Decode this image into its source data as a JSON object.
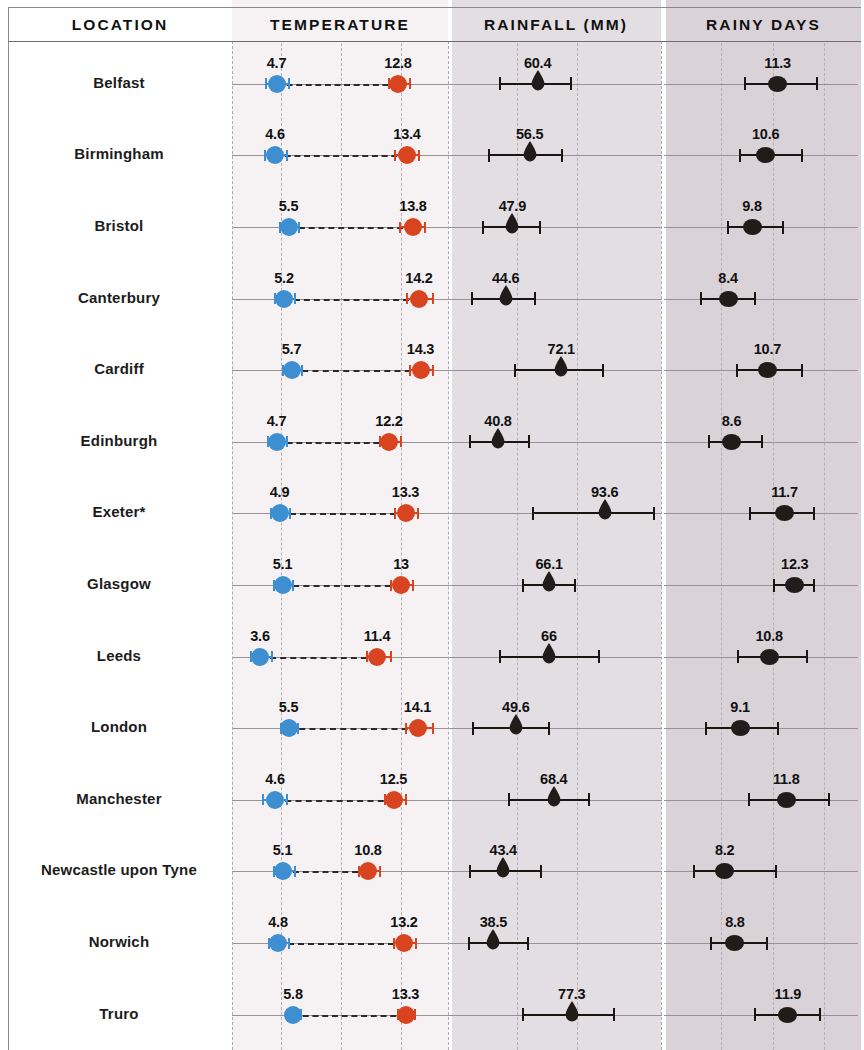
{
  "columns": {
    "location": "LOCATION",
    "temperature": "TEMPERATURE",
    "rainfall": "RAINFALL (MM)",
    "rainy_days": "RAINY DAYS"
  },
  "colors": {
    "min_temp": "#3d8fd1",
    "max_temp": "#d94420",
    "rainfall": "#211b19",
    "rainy_days": "#211b19",
    "panel_location_bg": "#ffffff",
    "panel_temperature_bg": "#f6f2f4",
    "panel_rainfall_bg": "#e3dee2",
    "panel_rainy_days_bg": "#d9d3d8",
    "gridline": "#b6afb8"
  },
  "chart_data": {
    "type": "scatter",
    "title": "",
    "subtitle": "",
    "note": "Dot-and-whisker small-multiples table. Each row is a UK city; each panel plots a mean value (marker) with a range/error bar (whiskers).",
    "panels": [
      {
        "key": "temperature",
        "label": "TEMPERATURE",
        "xlabel": "",
        "ylabel": "",
        "series": [
          {
            "name": "Minimum temperature",
            "color": "#3d8fd1",
            "marker": "circle"
          },
          {
            "name": "Maximum temperature",
            "color": "#d94420",
            "marker": "circle"
          }
        ],
        "xlim": [
          2.0,
          16.0
        ],
        "gridlines": [
          5.0,
          9.0,
          13.0
        ]
      },
      {
        "key": "rainfall",
        "label": "RAINFALL (MM)",
        "xlabel": "",
        "ylabel": "",
        "series": [
          {
            "name": "Mean monthly rainfall",
            "color": "#211b19",
            "marker": "raindrop"
          }
        ],
        "xlim": [
          20,
          120
        ],
        "gridlines": [
          50,
          80
        ]
      },
      {
        "key": "rainy_days",
        "label": "RAINY DAYS",
        "xlabel": "",
        "ylabel": "",
        "series": [
          {
            "name": "Mean rainy days",
            "color": "#211b19",
            "marker": "circle"
          }
        ],
        "xlim": [
          5.0,
          16.0
        ],
        "gridlines": [
          8.0,
          11.0,
          14.0
        ]
      }
    ],
    "categories": [
      "Belfast",
      "Birmingham",
      "Bristol",
      "Canterbury",
      "Cardiff",
      "Edinburgh",
      "Exeter*",
      "Glasgow",
      "Leeds",
      "London",
      "Manchester",
      "Newcastle upon Tyne",
      "Norwich",
      "Truro"
    ],
    "rows": [
      {
        "location": "Belfast",
        "temp_min": 4.7,
        "temp_min_label": "4.7",
        "temp_min_lo": 4.0,
        "temp_min_hi": 5.5,
        "temp_max": 12.8,
        "temp_max_label": "12.8",
        "temp_max_lo": 12.2,
        "temp_max_hi": 13.6,
        "rainfall": 60.4,
        "rainfall_label": "60.4",
        "rainfall_lo": 42.0,
        "rainfall_hi": 77.0,
        "rainy_days": 11.3,
        "rainy_days_label": "11.3",
        "rainy_days_lo": 9.4,
        "rainy_days_hi": 13.6
      },
      {
        "location": "Birmingham",
        "temp_min": 4.6,
        "temp_min_label": "4.6",
        "temp_min_lo": 3.9,
        "temp_min_hi": 5.4,
        "temp_max": 13.4,
        "temp_max_label": "13.4",
        "temp_max_lo": 12.6,
        "temp_max_hi": 14.2,
        "rainfall": 56.5,
        "rainfall_label": "56.5",
        "rainfall_lo": 36.5,
        "rainfall_hi": 72.5,
        "rainy_days": 10.6,
        "rainy_days_label": "10.6",
        "rainy_days_lo": 9.1,
        "rainy_days_hi": 12.7
      },
      {
        "location": "Bristol",
        "temp_min": 5.5,
        "temp_min_label": "5.5",
        "temp_min_lo": 4.9,
        "temp_min_hi": 6.2,
        "temp_max": 13.8,
        "temp_max_label": "13.8",
        "temp_max_lo": 12.9,
        "temp_max_hi": 14.6,
        "rainfall": 47.9,
        "rainfall_label": "47.9",
        "rainfall_lo": 33.5,
        "rainfall_hi": 61.5,
        "rainy_days": 9.8,
        "rainy_days_label": "9.8",
        "rainy_days_lo": 8.4,
        "rainy_days_hi": 11.6
      },
      {
        "location": "Canterbury",
        "temp_min": 5.2,
        "temp_min_label": "5.2",
        "temp_min_lo": 4.6,
        "temp_min_hi": 5.9,
        "temp_max": 14.2,
        "temp_max_label": "14.2",
        "temp_max_lo": 13.4,
        "temp_max_hi": 15.1,
        "rainfall": 44.6,
        "rainfall_label": "44.6",
        "rainfall_lo": 28.0,
        "rainfall_hi": 59.0,
        "rainy_days": 8.4,
        "rainy_days_label": "8.4",
        "rainy_days_lo": 6.8,
        "rainy_days_hi": 10.0
      },
      {
        "location": "Cardiff",
        "temp_min": 5.7,
        "temp_min_label": "5.7",
        "temp_min_lo": 5.1,
        "temp_min_hi": 6.4,
        "temp_max": 14.3,
        "temp_max_label": "14.3",
        "temp_max_lo": 13.6,
        "temp_max_hi": 15.1,
        "rainfall": 72.1,
        "rainfall_label": "72.1",
        "rainfall_lo": 49.0,
        "rainfall_hi": 93.0,
        "rainy_days": 10.7,
        "rainy_days_label": "10.7",
        "rainy_days_lo": 8.9,
        "rainy_days_hi": 12.7
      },
      {
        "location": "Edinburgh",
        "temp_min": 4.7,
        "temp_min_label": "4.7",
        "temp_min_lo": 4.1,
        "temp_min_hi": 5.4,
        "temp_max": 12.2,
        "temp_max_label": "12.2",
        "temp_max_lo": 11.6,
        "temp_max_hi": 13.0,
        "rainfall": 40.8,
        "rainfall_label": "40.8",
        "rainfall_lo": 27.0,
        "rainfall_hi": 56.0,
        "rainy_days": 8.6,
        "rainy_days_label": "8.6",
        "rainy_days_lo": 7.3,
        "rainy_days_hi": 10.4
      },
      {
        "location": "Exeter*",
        "temp_min": 4.9,
        "temp_min_label": "4.9",
        "temp_min_lo": 4.3,
        "temp_min_hi": 5.6,
        "temp_max": 13.3,
        "temp_max_label": "13.3",
        "temp_max_lo": 12.6,
        "temp_max_hi": 14.1,
        "rainfall": 93.6,
        "rainfall_label": "93.6",
        "rainfall_lo": 58.0,
        "rainfall_hi": 118.0,
        "rainy_days": 11.7,
        "rainy_days_label": "11.7",
        "rainy_days_lo": 9.7,
        "rainy_days_hi": 13.4
      },
      {
        "location": "Glasgow",
        "temp_min": 5.1,
        "temp_min_label": "5.1",
        "temp_min_lo": 4.5,
        "temp_min_hi": 5.8,
        "temp_max": 13.0,
        "temp_max_label": "13",
        "temp_max_lo": 12.3,
        "temp_max_hi": 13.8,
        "rainfall": 66.1,
        "rainfall_label": "66.1",
        "rainfall_lo": 53.0,
        "rainfall_hi": 79.0,
        "rainy_days": 12.3,
        "rainy_days_label": "12.3",
        "rainy_days_lo": 11.1,
        "rainy_days_hi": 13.4
      },
      {
        "location": "Leeds",
        "temp_min": 3.6,
        "temp_min_label": "3.6",
        "temp_min_lo": 3.0,
        "temp_min_hi": 4.4,
        "temp_max": 11.4,
        "temp_max_label": "11.4",
        "temp_max_lo": 10.7,
        "temp_max_hi": 12.3,
        "rainfall": 66.0,
        "rainfall_label": "66",
        "rainfall_lo": 42.0,
        "rainfall_hi": 91.0,
        "rainy_days": 10.8,
        "rainy_days_label": "10.8",
        "rainy_days_lo": 9.0,
        "rainy_days_hi": 13.0
      },
      {
        "location": "London",
        "temp_min": 5.5,
        "temp_min_label": "5.5",
        "temp_min_lo": 5.0,
        "temp_min_hi": 6.1,
        "temp_max": 14.1,
        "temp_max_label": "14.1",
        "temp_max_lo": 13.3,
        "temp_max_hi": 15.1,
        "rainfall": 49.6,
        "rainfall_label": "49.6",
        "rainfall_lo": 28.5,
        "rainfall_hi": 66.0,
        "rainy_days": 9.1,
        "rainy_days_label": "9.1",
        "rainy_days_lo": 7.1,
        "rainy_days_hi": 11.3
      },
      {
        "location": "Manchester",
        "temp_min": 4.6,
        "temp_min_label": "4.6",
        "temp_min_lo": 3.8,
        "temp_min_hi": 5.4,
        "temp_max": 12.5,
        "temp_max_label": "12.5",
        "temp_max_lo": 11.9,
        "temp_max_hi": 13.3,
        "rainfall": 68.4,
        "rainfall_label": "68.4",
        "rainfall_lo": 46.0,
        "rainfall_hi": 86.0,
        "rainy_days": 11.8,
        "rainy_days_label": "11.8",
        "rainy_days_lo": 9.6,
        "rainy_days_hi": 14.3
      },
      {
        "location": "Newcastle upon Tyne",
        "temp_min": 5.1,
        "temp_min_label": "5.1",
        "temp_min_lo": 4.5,
        "temp_min_hi": 5.9,
        "temp_max": 10.8,
        "temp_max_label": "10.8",
        "temp_max_lo": 10.2,
        "temp_max_hi": 11.6,
        "rainfall": 43.4,
        "rainfall_label": "43.4",
        "rainfall_lo": 27.0,
        "rainfall_hi": 62.0,
        "rainy_days": 8.2,
        "rainy_days_label": "8.2",
        "rainy_days_lo": 6.4,
        "rainy_days_hi": 11.2
      },
      {
        "location": "Norwich",
        "temp_min": 4.8,
        "temp_min_label": "4.8",
        "temp_min_lo": 4.2,
        "temp_min_hi": 5.5,
        "temp_max": 13.2,
        "temp_max_label": "13.2",
        "temp_max_lo": 12.5,
        "temp_max_hi": 14.0,
        "rainfall": 38.5,
        "rainfall_label": "38.5",
        "rainfall_lo": 26.5,
        "rainfall_hi": 55.5,
        "rainy_days": 8.8,
        "rainy_days_label": "8.8",
        "rainy_days_lo": 7.4,
        "rainy_days_hi": 10.7
      },
      {
        "location": "Truro",
        "temp_min": 5.8,
        "temp_min_label": "5.8",
        "temp_min_lo": 5.4,
        "temp_min_hi": 6.3,
        "temp_max": 13.3,
        "temp_max_label": "13.3",
        "temp_max_lo": 12.8,
        "temp_max_hi": 13.9,
        "rainfall": 77.3,
        "rainfall_label": "77.3",
        "rainfall_lo": 53.0,
        "rainfall_hi": 98.0,
        "rainy_days": 11.9,
        "rainy_days_label": "11.9",
        "rainy_days_lo": 10.0,
        "rainy_days_hi": 13.8
      }
    ]
  }
}
